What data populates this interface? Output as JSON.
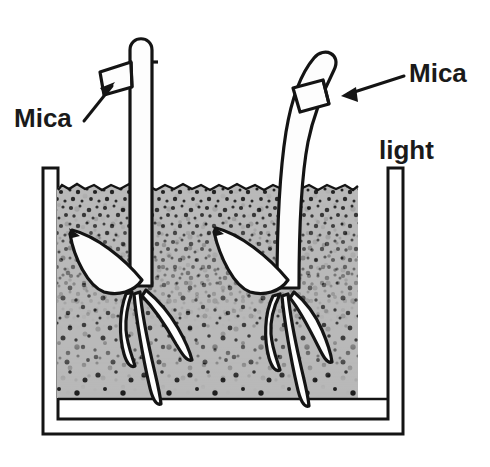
{
  "figure": {
    "domain_kind": "biology-diagram",
    "background_color": "#ffffff",
    "ink_color": "#151515",
    "soil_color": "#b9b9b9",
    "plant_fill_color": "#fdfdfd",
    "labels": {
      "mica_left": "Mica",
      "mica_right": "Mica",
      "light": "light"
    },
    "parts": {
      "container_name": "soil-container",
      "soil_name": "soil-medium",
      "left_seedling_name": "left-seedling",
      "right_seedling_name": "right-seedling",
      "left_mica_name": "left-mica-plate",
      "right_mica_name": "right-mica-plate"
    },
    "observations": {
      "left_coleoptile": "straight, mica inserted on shaded (left) side",
      "right_coleoptile": "bent toward light, mica inserted on lit (right) side",
      "light_direction": "from the right"
    }
  }
}
